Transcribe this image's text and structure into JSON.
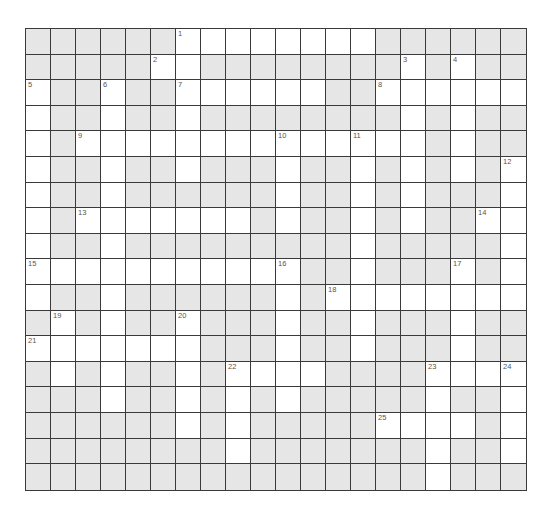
{
  "puzzle": {
    "cols": 20,
    "rows": 18,
    "colors": {
      "block": "#e6e6e6",
      "open": "#ffffff",
      "border": "#3a3a3a",
      "number": "#555555"
    },
    "open_cells": [
      [
        6,
        7,
        8,
        9,
        10,
        11,
        12,
        13
      ],
      [
        5,
        6,
        15,
        17
      ],
      [
        0,
        3,
        6,
        7,
        8,
        9,
        10,
        11,
        14,
        15,
        16,
        17,
        18,
        19
      ],
      [
        0,
        3,
        6,
        15,
        17
      ],
      [
        0,
        2,
        3,
        4,
        5,
        6,
        7,
        8,
        9,
        10,
        11,
        12,
        13,
        14,
        15,
        17
      ],
      [
        0,
        3,
        6,
        10,
        13,
        15,
        17,
        19
      ],
      [
        0,
        3,
        10,
        13,
        15,
        19
      ],
      [
        0,
        2,
        3,
        4,
        5,
        6,
        7,
        8,
        10,
        13,
        15,
        18,
        19
      ],
      [
        0,
        3,
        13,
        19
      ],
      [
        0,
        1,
        2,
        3,
        4,
        5,
        6,
        7,
        8,
        9,
        10,
        13,
        17,
        19
      ],
      [
        0,
        3,
        10,
        12,
        13,
        14,
        15,
        16,
        17,
        18,
        19
      ],
      [
        1,
        3,
        6,
        10,
        13,
        17
      ],
      [
        0,
        1,
        2,
        3,
        4,
        5,
        6,
        10,
        13,
        17
      ],
      [
        1,
        3,
        6,
        8,
        9,
        10,
        11,
        16,
        17,
        18,
        19
      ],
      [
        3,
        6,
        8,
        10,
        16,
        19
      ],
      [
        6,
        8,
        14,
        15,
        16,
        17,
        19
      ],
      [
        8,
        16,
        19
      ],
      [
        16
      ]
    ],
    "clue_numbers": [
      {
        "n": "1",
        "row": 0,
        "col": 6
      },
      {
        "n": "2",
        "row": 1,
        "col": 5
      },
      {
        "n": "3",
        "row": 1,
        "col": 15
      },
      {
        "n": "4",
        "row": 1,
        "col": 17
      },
      {
        "n": "5",
        "row": 2,
        "col": 0
      },
      {
        "n": "6",
        "row": 2,
        "col": 3
      },
      {
        "n": "7",
        "row": 2,
        "col": 6
      },
      {
        "n": "8",
        "row": 2,
        "col": 14
      },
      {
        "n": "9",
        "row": 4,
        "col": 2
      },
      {
        "n": "10",
        "row": 4,
        "col": 10
      },
      {
        "n": "11",
        "row": 4,
        "col": 13
      },
      {
        "n": "12",
        "row": 5,
        "col": 19
      },
      {
        "n": "13",
        "row": 7,
        "col": 2
      },
      {
        "n": "14",
        "row": 7,
        "col": 18
      },
      {
        "n": "15",
        "row": 9,
        "col": 0
      },
      {
        "n": "16",
        "row": 9,
        "col": 10
      },
      {
        "n": "17",
        "row": 9,
        "col": 17
      },
      {
        "n": "18",
        "row": 10,
        "col": 12
      },
      {
        "n": "19",
        "row": 11,
        "col": 1
      },
      {
        "n": "20",
        "row": 11,
        "col": 6
      },
      {
        "n": "21",
        "row": 12,
        "col": 0
      },
      {
        "n": "22",
        "row": 13,
        "col": 8
      },
      {
        "n": "23",
        "row": 13,
        "col": 16
      },
      {
        "n": "24",
        "row": 13,
        "col": 19
      },
      {
        "n": "25",
        "row": 15,
        "col": 14
      }
    ]
  }
}
